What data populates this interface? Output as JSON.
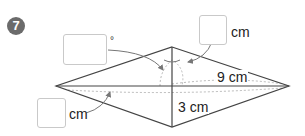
{
  "problem": {
    "number": "7"
  },
  "figure": {
    "shape": "rhombus",
    "vertices": {
      "top": [
        172,
        47
      ],
      "bottom": [
        172,
        127
      ],
      "left": [
        56,
        86
      ],
      "right": [
        289,
        86
      ]
    },
    "colors": {
      "outline": "#444444",
      "dashed": "#bbbbbb",
      "arrow": "#777777",
      "badge": "#6b6b6b",
      "box_border": "#c9c9c9"
    }
  },
  "labels": {
    "half_long_diagonal": "9 cm",
    "half_short_diagonal": "3 cm"
  },
  "answer_boxes": [
    {
      "id": "angle",
      "unit": "°"
    },
    {
      "id": "top_length",
      "unit": "cm"
    },
    {
      "id": "left_length",
      "unit": "cm"
    }
  ]
}
